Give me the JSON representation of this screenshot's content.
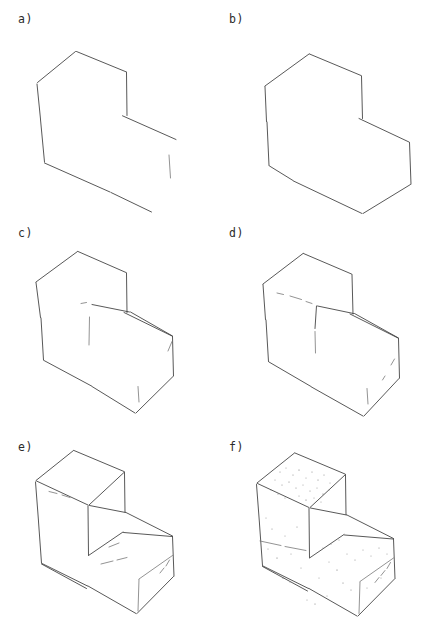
{
  "figure": {
    "background_color": "#ffffff",
    "ink_color": "#3a3a3a",
    "width": 423,
    "height": 642,
    "layout": "2 columns x 3 rows"
  },
  "panels": [
    {
      "id": "a",
      "label": "a)",
      "caption_text": "a)",
      "stage": "partial 2D silhouette outline, open contour",
      "col": 0,
      "row": 0
    },
    {
      "id": "b",
      "label": "b)",
      "caption_text": "b)",
      "stage": "closed 2D silhouette outline",
      "col": 1,
      "row": 0
    },
    {
      "id": "c",
      "label": "c)",
      "caption_text": "c)",
      "stage": "silhouette with first internal edges",
      "col": 0,
      "row": 1
    },
    {
      "id": "d",
      "label": "d)",
      "caption_text": "d)",
      "stage": "silhouette with additional internal edges",
      "col": 1,
      "row": 1
    },
    {
      "id": "e",
      "label": "e)",
      "caption_text": "e)",
      "stage": "complete 3D wireframe of L-shaped block",
      "col": 0,
      "row": 2
    },
    {
      "id": "f",
      "label": "f)",
      "caption_text": "f)",
      "stage": "complete 3D wireframe with shaded/speckled texture",
      "col": 1,
      "row": 2
    }
  ]
}
